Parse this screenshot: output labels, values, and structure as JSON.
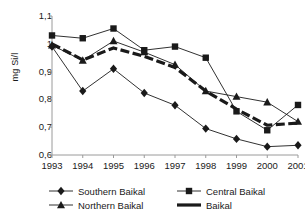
{
  "chart_data": {
    "type": "line",
    "title": "",
    "xlabel": "",
    "ylabel": "mg Si/l",
    "categories": [
      "1993",
      "1994",
      "1995",
      "1996",
      "1997",
      "1998",
      "1999",
      "2000",
      "2001"
    ],
    "ylim": [
      0.6,
      1.1
    ],
    "ytick_labels": [
      "1,1",
      "1",
      "0,9",
      "0,8",
      "0,7",
      "0,6"
    ],
    "ytick_values": [
      1.1,
      1.0,
      0.9,
      0.8,
      0.7,
      0.6
    ],
    "grid": false,
    "legend_position": "bottom",
    "series": [
      {
        "name": "Southern Baikal",
        "marker": "diamond",
        "color": "#1a1a1a",
        "values": [
          0.99,
          0.83,
          0.91,
          0.823,
          0.779,
          0.695,
          0.658,
          0.63,
          0.635
        ]
      },
      {
        "name": "Central Baikal",
        "marker": "square",
        "color": "#1a1a1a",
        "values": [
          1.03,
          1.02,
          1.055,
          0.977,
          0.99,
          0.95,
          0.757,
          0.689,
          0.78
        ]
      },
      {
        "name": "Northern Baikal",
        "marker": "triangle",
        "color": "#1a1a1a",
        "values": [
          0.995,
          0.94,
          1.01,
          0.97,
          0.925,
          0.83,
          0.81,
          0.79,
          0.72
        ]
      },
      {
        "name": "Baikal",
        "marker": "none",
        "color": "#1a1a1a",
        "values": [
          1.0,
          0.942,
          0.985,
          0.955,
          0.915,
          0.83,
          0.765,
          0.707,
          0.715
        ]
      }
    ]
  },
  "legend": {
    "items": [
      {
        "label": "Southern Baikal",
        "marker": "diamond"
      },
      {
        "label": "Central Baikal",
        "marker": "square"
      },
      {
        "label": "Northern Baikal",
        "marker": "triangle"
      },
      {
        "label": "Baikal",
        "marker": "thickline"
      }
    ]
  }
}
